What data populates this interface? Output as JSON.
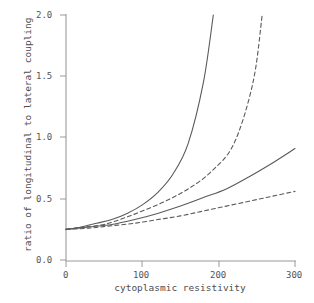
{
  "chart_data": {
    "type": "line",
    "title": "",
    "xlabel": "cytoplasmic resistivity",
    "ylabel": "ratio of longitudinal to lateral coupling",
    "xlim": [
      0,
      300
    ],
    "ylim": [
      0,
      2.0
    ],
    "xticks": [
      0,
      100,
      200,
      300
    ],
    "xtick_labels": [
      "0",
      "100",
      "200",
      "300"
    ],
    "yticks": [
      0.0,
      0.5,
      1.0,
      1.5,
      2.0
    ],
    "ytick_labels": [
      "0.0",
      "0.5",
      "1.0",
      "1.5",
      "2.0"
    ],
    "grid": false,
    "legend": false,
    "legend_position": "none",
    "background_color": "#ffffff",
    "axis_color": "#808080",
    "line_color": "#5a5a5a",
    "series": [
      {
        "name": "curve-1",
        "style": "solid",
        "x": [
          0,
          20,
          40,
          60,
          80,
          100,
          120,
          140,
          160,
          180,
          193
        ],
        "values": [
          0.25,
          0.27,
          0.3,
          0.33,
          0.38,
          0.45,
          0.55,
          0.7,
          0.95,
          1.45,
          2.0
        ]
      },
      {
        "name": "curve-2",
        "style": "dashed",
        "x": [
          0,
          25,
          50,
          75,
          100,
          130,
          160,
          190,
          220,
          245,
          257
        ],
        "values": [
          0.25,
          0.27,
          0.29,
          0.34,
          0.4,
          0.48,
          0.58,
          0.72,
          0.95,
          1.45,
          2.0
        ]
      },
      {
        "name": "curve-3",
        "style": "solid",
        "x": [
          0,
          30,
          60,
          90,
          120,
          150,
          180,
          210,
          240,
          270,
          300
        ],
        "values": [
          0.25,
          0.27,
          0.29,
          0.33,
          0.38,
          0.44,
          0.51,
          0.58,
          0.68,
          0.79,
          0.91
        ]
      },
      {
        "name": "curve-4",
        "style": "dashed",
        "x": [
          0,
          30,
          60,
          90,
          120,
          150,
          180,
          210,
          240,
          270,
          300
        ],
        "values": [
          0.25,
          0.26,
          0.28,
          0.3,
          0.33,
          0.36,
          0.4,
          0.44,
          0.48,
          0.52,
          0.56
        ]
      }
    ]
  },
  "axes": {
    "x_tick_labels": [
      "0",
      "100",
      "200",
      "300"
    ],
    "y_tick_labels": [
      "0.0",
      "0.5",
      "1.0",
      "1.5",
      "2.0"
    ],
    "x_axis_title": "cytoplasmic resistivity",
    "y_axis_title": "ratio of longitudinal to lateral coupling"
  }
}
